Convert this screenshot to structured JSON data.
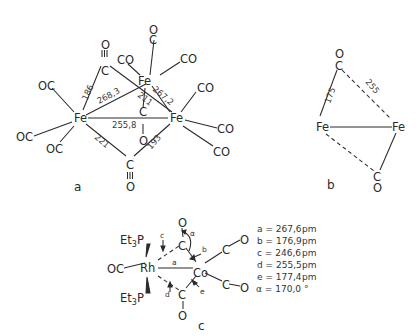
{
  "diagram_a": {
    "label": "a",
    "atoms": {
      "fe_left": "Fe",
      "fe_top": "Fe",
      "fe_right": "Fe",
      "co_left_1": "OC",
      "co_left_2": "OC",
      "co_left_3": "OC",
      "co_top_c": "C",
      "co_top_o": "O",
      "co_top_left": "CO",
      "co_top_right": "CO",
      "co_right_1": "CO",
      "co_right_2": "CO",
      "co_right_3": "CO",
      "bridge_top_c": "C",
      "bridge_top_o": "O",
      "bridge_top_bond": "|||",
      "bridge_mid_c": "C",
      "bridge_mid_o": "O",
      "bridge_bot_c": "C",
      "bridge_bot_o": "O",
      "bridge_bot_bond": "|||"
    },
    "distances": {
      "c_top_fe_left": "186",
      "fe_left_fe_top": "268,3",
      "fe_top_fe_right": "267,2",
      "fe_top_c_mid": "211",
      "fe_left_fe_right": "255,8",
      "fe_left_c_bot": "221",
      "fe_right_c_bot": "193"
    }
  },
  "diagram_b": {
    "label": "b",
    "atoms": {
      "fe_left": "Fe",
      "fe_right": "Fe",
      "c_top": "C",
      "o_top": "O",
      "c_bot": "C",
      "o_bot": "O"
    },
    "distances": {
      "fe_left_c_top": "175",
      "fe_right_c_top": "255"
    }
  },
  "diagram_c": {
    "label": "c",
    "atoms": {
      "rh": "Rh",
      "co": "Co",
      "pet3_top": "Et",
      "pet3_top_sub": "3",
      "pet3_top_p": "P",
      "pet3_bot": "Et",
      "pet3_bot_sub": "3",
      "pet3_bot_p": "P",
      "oc_left": "OC",
      "c_top": "C",
      "o_top": "O",
      "c_bot": "C",
      "o_bot": "O",
      "c_right1": "C",
      "o_right1": "O",
      "c_right2": "C",
      "o_right2": "O"
    },
    "bond_labels": {
      "a": "a",
      "b": "b",
      "c": "c",
      "d": "d",
      "e": "e",
      "alpha": "α"
    },
    "legend": [
      {
        "key": "a",
        "value": "267,6",
        "unit": "pm"
      },
      {
        "key": "b",
        "value": "176,9",
        "unit": "pm"
      },
      {
        "key": "c",
        "value": "246,6",
        "unit": "pm"
      },
      {
        "key": "d",
        "value": "255,5",
        "unit": "pm"
      },
      {
        "key": "e",
        "value": "177,4",
        "unit": "pm"
      },
      {
        "key": "α",
        "value": "170,0",
        "unit": "°"
      }
    ]
  }
}
